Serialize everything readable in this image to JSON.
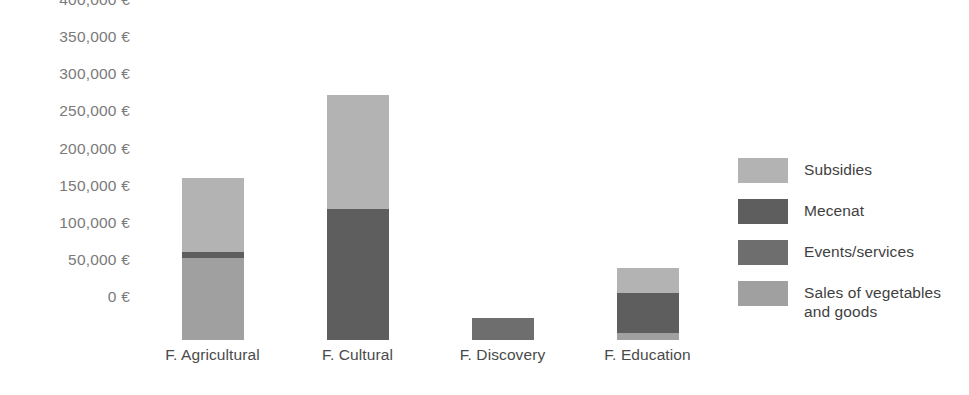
{
  "chart_data": {
    "type": "bar",
    "stacked": true,
    "title": "",
    "xlabel": "",
    "ylabel": "",
    "ylim": [
      0,
      400000
    ],
    "ytick_values": [
      0,
      50000,
      100000,
      150000,
      200000,
      250000,
      300000,
      350000,
      400000
    ],
    "ytick_labels": [
      "0 €",
      "50,000 €",
      "100,000 €",
      "150,000 €",
      "200,000 €",
      "250,000 €",
      "300,000 €",
      "350,000 €",
      "400,000 €"
    ],
    "categories": [
      "F. Agricultural",
      "F. Cultural",
      "F. Discovery",
      "F. Education"
    ],
    "grid": false,
    "legend_position": "right",
    "currency": "€",
    "series": [
      {
        "name": "Subsidies",
        "color": "#b3b3b3",
        "values": [
          100000,
          154000,
          0,
          34000
        ]
      },
      {
        "name": "Mecenat",
        "color": "#5e5e5e",
        "values": [
          8000,
          176000,
          0,
          54000
        ]
      },
      {
        "name": "Events/services",
        "color": "#6e6e6e",
        "values": [
          0,
          0,
          30000,
          0
        ]
      },
      {
        "name": "Sales of vegetables and goods",
        "color": "#a0a0a0",
        "values": [
          110000,
          0,
          0,
          9000
        ]
      }
    ],
    "totals": [
      218000,
      330000,
      30000,
      97000
    ]
  }
}
